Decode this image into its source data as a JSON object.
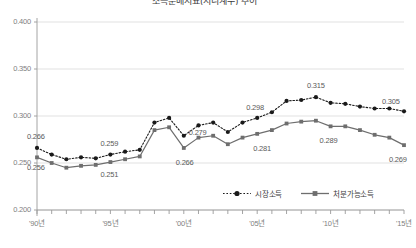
{
  "chart_title": "소득분배지표(지니계수) 추이",
  "legend": {
    "position": "bottom-right",
    "items": [
      {
        "name": "시장소득",
        "style": "dotted",
        "marker": "circle",
        "color": "#1a1a1a"
      },
      {
        "name": "처분가능소득",
        "style": "solid",
        "marker": "square",
        "color": "#6e6e6e"
      }
    ]
  },
  "axis": {
    "y_ticks": [
      "0.400",
      "0.350",
      "0.300",
      "0.250",
      "0.200"
    ],
    "x_ticks": [
      "'90년",
      "'95년",
      "'00년",
      "'05년",
      "'10년",
      "'15년"
    ]
  },
  "chart_data": {
    "type": "line",
    "title": "소득분배지표(지니계수) 추이",
    "xlabel": "",
    "ylabel": "",
    "ylim": [
      0.2,
      0.4
    ],
    "xlim": [
      1990,
      2015
    ],
    "grid": true,
    "legend_position": "bottom-right",
    "x": [
      1990,
      1991,
      1992,
      1993,
      1994,
      1995,
      1996,
      1997,
      1998,
      1999,
      2000,
      2001,
      2002,
      2003,
      2004,
      2005,
      2006,
      2007,
      2008,
      2009,
      2010,
      2011,
      2012,
      2013,
      2014,
      2015
    ],
    "series": [
      {
        "name": "시장소득",
        "style": "dotted",
        "marker": "circle",
        "color": "#1a1a1a",
        "values": [
          0.266,
          0.259,
          0.254,
          0.256,
          0.255,
          0.259,
          0.262,
          0.264,
          0.293,
          0.298,
          0.279,
          0.29,
          0.293,
          0.283,
          0.293,
          0.298,
          0.304,
          0.316,
          0.317,
          0.32,
          0.314,
          0.313,
          0.31,
          0.308,
          0.308,
          0.305
        ]
      },
      {
        "name": "처분가능소득",
        "style": "solid",
        "marker": "square",
        "color": "#6e6e6e",
        "values": [
          0.256,
          0.25,
          0.245,
          0.247,
          0.248,
          0.251,
          0.254,
          0.257,
          0.285,
          0.288,
          0.266,
          0.277,
          0.279,
          0.27,
          0.277,
          0.281,
          0.285,
          0.292,
          0.294,
          0.295,
          0.289,
          0.289,
          0.285,
          0.28,
          0.277,
          0.269
        ]
      }
    ],
    "point_labels": [
      {
        "series": "시장소득",
        "x": 1990,
        "value": 0.266,
        "text": "0.266"
      },
      {
        "series": "처분가능소득",
        "x": 1990,
        "value": 0.256,
        "text": "0.256"
      },
      {
        "series": "처분가능소득",
        "x": 1995,
        "value": 0.251,
        "text": "0.251"
      },
      {
        "series": "시장소득",
        "x": 1995,
        "value": 0.259,
        "text": "0.259"
      },
      {
        "series": "시장소득",
        "x": 2000,
        "value": 0.279,
        "text": "0.279"
      },
      {
        "series": "처분가능소득",
        "x": 2000,
        "value": 0.266,
        "text": "0.266"
      },
      {
        "series": "처분가능소득",
        "x": 2005,
        "value": 0.281,
        "text": "0.281"
      },
      {
        "series": "시장소득",
        "x": 2005,
        "value": 0.298,
        "text": "0.298"
      },
      {
        "series": "시장소득",
        "x": 2009,
        "value": 0.32,
        "text": "0.315"
      },
      {
        "series": "처분가능소득",
        "x": 2010,
        "value": 0.289,
        "text": "0.289"
      },
      {
        "series": "시장소득",
        "x": 2015,
        "value": 0.305,
        "text": "0.305"
      },
      {
        "series": "처분가능소득",
        "x": 2015,
        "value": 0.269,
        "text": "0.269"
      }
    ]
  }
}
